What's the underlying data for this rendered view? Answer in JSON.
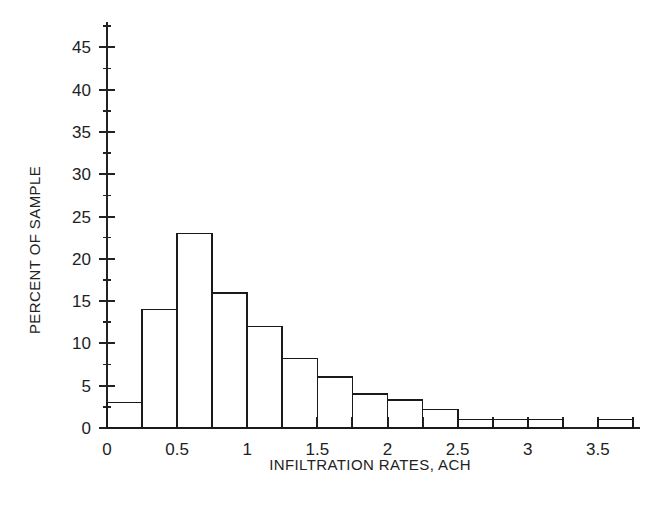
{
  "chart_data": {
    "type": "bar",
    "title": "",
    "subtitle": "",
    "xlabel": "INFILTRATION RATES, ACH",
    "ylabel": "PERCENT OF SAMPLE",
    "xlim": [
      0,
      3.8
    ],
    "ylim": [
      0,
      48
    ],
    "grid": false,
    "legend": null,
    "bin_width": 0.25,
    "x_ticks": [
      0,
      0.5,
      1,
      1.5,
      2,
      2.5,
      3,
      3.5
    ],
    "x_tick_labels": [
      "0",
      "0.5",
      "1",
      "1.5",
      "2",
      "2.5",
      "3",
      "3.5"
    ],
    "x_minor_ticks": [
      0.25,
      0.75,
      1.25,
      1.75,
      2.25,
      2.75,
      3.25,
      3.75
    ],
    "y_ticks": [
      0,
      5,
      10,
      15,
      20,
      25,
      30,
      35,
      40,
      45
    ],
    "y_tick_labels": [
      "0",
      "5",
      "10",
      "15",
      "20",
      "25",
      "30",
      "35",
      "40",
      "45"
    ],
    "y_minor_ticks": [
      2.5,
      7.5,
      12.5,
      17.5,
      22.5,
      27.5,
      32.5,
      37.5,
      42.5,
      47.5
    ],
    "categories": [
      "0-0.25",
      "0.25-0.5",
      "0.5-0.75",
      "0.75-1.0",
      "1.0-1.25",
      "1.25-1.5",
      "1.5-1.75",
      "1.75-2.0",
      "2.0-2.25",
      "2.25-2.5",
      "2.5-2.75",
      "2.75-3.0",
      "3.0-3.25",
      "3.25-3.5",
      "3.5-3.75"
    ],
    "bin_starts": [
      0,
      0.25,
      0.5,
      0.75,
      1.0,
      1.25,
      1.5,
      1.75,
      2.0,
      2.25,
      2.5,
      2.75,
      3.0,
      3.25,
      3.5
    ],
    "values": [
      3,
      14,
      23,
      16,
      12,
      8.2,
      6,
      4,
      3.3,
      2.2,
      1,
      1,
      1,
      0,
      1
    ],
    "bar_fill": "#ffffff",
    "bar_stroke": "#1a1a1a",
    "axis_color": "#222222"
  },
  "axes": {
    "y_axis_title": "PERCENT OF SAMPLE",
    "x_axis_title": "INFILTRATION RATES, ACH"
  }
}
